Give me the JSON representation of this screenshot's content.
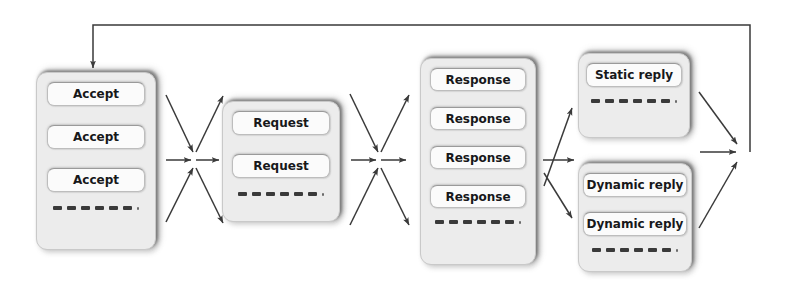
{
  "diagram": {
    "background_color": "#ffffff",
    "stage_fill": "#ececec",
    "item_fill": "#fbfbfb",
    "line_color": "#3a3a3a",
    "stages": [
      {
        "id": "accept-queue",
        "name": "Accept queue",
        "x": 36,
        "y": 72,
        "w": 120,
        "h": 178,
        "item_w": 98,
        "item_h": 24,
        "item_gap": 19,
        "font_size": 12,
        "items": [
          {
            "label": "Accept"
          },
          {
            "label": "Accept"
          },
          {
            "label": "Accept"
          }
        ],
        "dashes": 6,
        "dashes_margin_top": 14
      },
      {
        "id": "request-queue",
        "name": "Request queue",
        "x": 222,
        "y": 101,
        "w": 118,
        "h": 121,
        "item_w": 98,
        "item_h": 24,
        "item_gap": 19,
        "font_size": 12,
        "items": [
          {
            "label": "Request"
          },
          {
            "label": "Request"
          }
        ],
        "dashes": 6,
        "dashes_margin_top": 14
      },
      {
        "id": "response-queue",
        "name": "Response queue",
        "x": 420,
        "y": 58,
        "w": 116,
        "h": 207,
        "item_w": 96,
        "item_h": 23,
        "item_gap": 16,
        "font_size": 12,
        "items": [
          {
            "label": "Response"
          },
          {
            "label": "Response"
          },
          {
            "label": "Response"
          },
          {
            "label": "Response"
          }
        ],
        "dashes": 6,
        "dashes_margin_top": 12
      },
      {
        "id": "static-reply-queue",
        "name": "Static reply queue",
        "x": 578,
        "y": 53,
        "w": 112,
        "h": 85,
        "item_w": 96,
        "item_h": 24,
        "item_gap": 16,
        "font_size": 12,
        "items": [
          {
            "label": "Static reply"
          }
        ],
        "dashes": 6,
        "dashes_margin_top": 12
      },
      {
        "id": "dynamic-reply-queue",
        "name": "Dynamic reply queue",
        "x": 578,
        "y": 163,
        "w": 114,
        "h": 109,
        "item_w": 104,
        "item_h": 24,
        "item_gap": 15,
        "font_size": 12,
        "items": [
          {
            "label": "Dynamic reply"
          },
          {
            "label": "Dynamic reply"
          }
        ],
        "dashes": 6,
        "dashes_margin_top": 12
      }
    ],
    "connectors": [
      {
        "id": "accept-to-request-fanin-upper",
        "name": "diagonal-arrow-down-right",
        "from": [
          166,
          95
        ],
        "to": [
          193,
          152
        ]
      },
      {
        "id": "accept-to-request-fanin-lower",
        "name": "diagonal-arrow-up-right",
        "from": [
          166,
          222
        ],
        "to": [
          193,
          168
        ]
      },
      {
        "id": "accept-to-hub",
        "name": "horizontal-arrow-right",
        "from": [
          166,
          160
        ],
        "to": [
          191,
          160
        ]
      },
      {
        "id": "hub-to-request",
        "name": "horizontal-arrow-right",
        "from": [
          196,
          160
        ],
        "to": [
          219,
          160
        ]
      },
      {
        "id": "hub-to-request-fanout-upper",
        "name": "diagonal-arrow-up-right",
        "from": [
          196,
          152
        ],
        "to": [
          223,
          96
        ]
      },
      {
        "id": "hub-to-request-fanout-lower",
        "name": "diagonal-arrow-down-right",
        "from": [
          196,
          168
        ],
        "to": [
          223,
          223
        ]
      },
      {
        "id": "request-to-response-fanin-upper",
        "name": "diagonal-arrow-down-right",
        "from": [
          350,
          94
        ],
        "to": [
          378,
          152
        ]
      },
      {
        "id": "request-to-response-fanin-lower",
        "name": "diagonal-arrow-up-right",
        "from": [
          350,
          225
        ],
        "to": [
          378,
          168
        ]
      },
      {
        "id": "request-to-hub2",
        "name": "horizontal-arrow-right",
        "from": [
          351,
          160
        ],
        "to": [
          376,
          160
        ]
      },
      {
        "id": "hub2-to-response",
        "name": "horizontal-arrow-right",
        "from": [
          381,
          160
        ],
        "to": [
          406,
          160
        ]
      },
      {
        "id": "hub2-fanout-upper",
        "name": "diagonal-arrow-up-right",
        "from": [
          381,
          152
        ],
        "to": [
          409,
          95
        ]
      },
      {
        "id": "hub2-fanout-lower",
        "name": "diagonal-arrow-down-right",
        "from": [
          381,
          168
        ],
        "to": [
          409,
          225
        ]
      },
      {
        "id": "response-to-static-reply",
        "name": "diagonal-arrow-up-right",
        "from": [
          544,
          186
        ],
        "to": [
          572,
          108
        ]
      },
      {
        "id": "response-to-dynamic-reply-horizontal",
        "name": "horizontal-arrow-right",
        "from": [
          543,
          160
        ],
        "to": [
          574,
          160
        ]
      },
      {
        "id": "response-to-dynamic-reply-diagonal",
        "name": "diagonal-arrow-down-right",
        "from": [
          544,
          173
        ],
        "to": [
          572,
          218
        ]
      },
      {
        "id": "static-reply-to-merge",
        "name": "diagonal-arrow-down-right",
        "from": [
          699,
          92
        ],
        "to": [
          737,
          144
        ]
      },
      {
        "id": "dynamic-reply-to-merge-horizontal",
        "name": "horizontal-arrow-right",
        "from": [
          700,
          152
        ],
        "to": [
          736,
          152
        ]
      },
      {
        "id": "dynamic-reply-to-merge-diagonal",
        "name": "diagonal-arrow-up-right",
        "from": [
          699,
          228
        ],
        "to": [
          737,
          162
        ]
      },
      {
        "id": "feedback-loop",
        "name": "feedback-arrow-to-accept-queue",
        "path": [
          [
            750,
            152
          ],
          [
            750,
            25
          ],
          [
            93,
            25
          ],
          [
            93,
            68
          ]
        ]
      }
    ]
  }
}
